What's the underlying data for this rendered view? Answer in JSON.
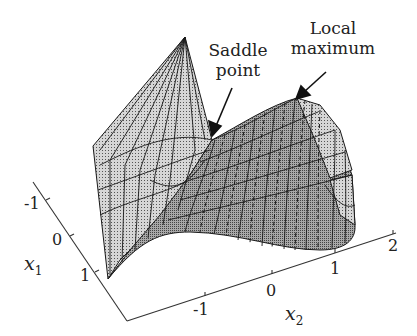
{
  "figure": {
    "type": "3d-surface",
    "annotations": {
      "saddle": {
        "line1": "Saddle",
        "line2": "point"
      },
      "local_max": {
        "line1": "Local",
        "line2": "maximum"
      }
    },
    "axes": {
      "x1": {
        "label": "x",
        "sub": "1",
        "ticks": [
          "-1",
          "0",
          "1"
        ]
      },
      "x2": {
        "label": "x",
        "sub": "2",
        "ticks": [
          "-1",
          "0",
          "1",
          "2"
        ]
      }
    },
    "colors": {
      "surface_light": "#c9c9c9",
      "surface_dark": "#9a9a9a",
      "ink": "#222222"
    }
  }
}
